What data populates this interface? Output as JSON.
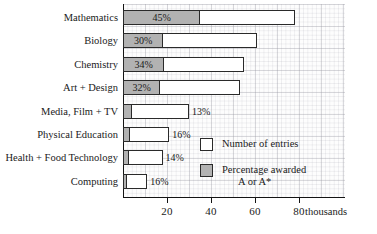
{
  "chart_data": {
    "type": "bar",
    "orientation": "horizontal",
    "title": "",
    "subtitle": "",
    "xlabel": "thousands",
    "ylabel": "",
    "xlim": [
      0,
      101
    ],
    "xticks": [
      20,
      40,
      60,
      80
    ],
    "xtick_labels": [
      "20",
      "40",
      "60",
      "80"
    ],
    "grid": true,
    "grid_style": "graph-paper",
    "legend_position": "inside-right",
    "categories": [
      "Mathematics",
      "Biology",
      "Chemistry",
      "Art + Design",
      "Media, Film + TV",
      "Physical Education",
      "Health + Food Technology",
      "Computing"
    ],
    "series": [
      {
        "name": "Number of entries",
        "units": "thousands",
        "values": [
          78,
          61,
          55,
          53,
          30,
          21,
          18,
          11
        ]
      },
      {
        "name": "Percentage awarded A or A*",
        "units": "percent",
        "values": [
          45,
          30,
          34,
          32,
          13,
          16,
          14,
          16
        ]
      }
    ],
    "bar_pct_widths_thousands": [
      35.1,
      18.3,
      18.7,
      17.0,
      3.9,
      3.4,
      2.5,
      1.8
    ],
    "data_labels": [
      "45%",
      "30%",
      "34%",
      "32%",
      "13%",
      "16%",
      "14%",
      "16%"
    ],
    "data_label_placement": [
      "inside",
      "inside",
      "inside",
      "inside",
      "outside",
      "outside",
      "outside",
      "outside"
    ],
    "colors": {
      "entries_fill": "#ffffff",
      "pct_fill": "#b2b2b2",
      "bar_outline": "#2a2a2a",
      "axis": "#141414",
      "grid_major": "#96969a",
      "grid_minor": "#a5a5af",
      "text": "#1a1a1a"
    }
  },
  "legend": {
    "entries_label": "Number of entries",
    "pct_label_line1": "Percentage awarded",
    "pct_label_line2": "A or A*"
  },
  "axis": {
    "unit_label": "thousands"
  }
}
